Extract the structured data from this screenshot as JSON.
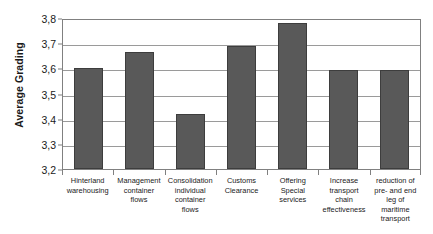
{
  "chart_data": {
    "type": "bar",
    "title": "",
    "xlabel": "",
    "ylabel": "Average Grading",
    "ylim": [
      3.2,
      3.8
    ],
    "ytick_labels": [
      "3,8",
      "3,7",
      "3,6",
      "3,5",
      "3,4",
      "3,3",
      "3,2"
    ],
    "ytick_values": [
      3.8,
      3.7,
      3.6,
      3.5,
      3.4,
      3.3,
      3.2
    ],
    "grid": true,
    "legend": "none",
    "decimal_separator": ",",
    "bar_color": "#595959",
    "categories": [
      "Hinterland\nwarehousing",
      "Management\ncontainer\nflows",
      "Consolidation\nindividual\ncontainer\nflows",
      "Customs\nClearance",
      "Offering\nSpecial\nservices",
      "Increase\ntransport\nchain\neffectiveness",
      "reduction of\npre- and end\nleg of\nmaritime\ntransport"
    ],
    "values": [
      3.6,
      3.665,
      3.42,
      3.69,
      3.78,
      3.595,
      3.595
    ]
  }
}
